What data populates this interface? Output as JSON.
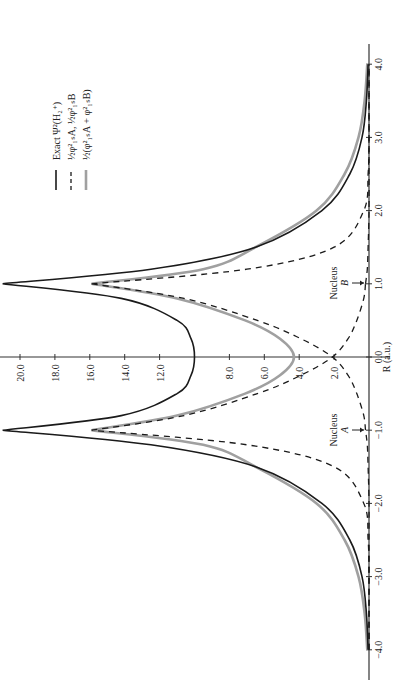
{
  "chart_data": {
    "type": "line",
    "orientation": "rotated-90-ccw",
    "title": "",
    "xlabel": "R (a.u.)",
    "ylabel": "",
    "xlim": [
      -4.2,
      4.3
    ],
    "ylim": [
      0,
      21
    ],
    "x_ticks": [
      "-4.0",
      "-3.0",
      "-2.0",
      "-1.0",
      "0.0",
      "1.0",
      "2.0",
      "3.0",
      "4.0"
    ],
    "x_tick_values": [
      -4.0,
      -3.0,
      -2.0,
      -1.0,
      0.0,
      1.0,
      2.0,
      3.0,
      4.0
    ],
    "y_ticks": [
      "2.0",
      "4.0",
      "6.0",
      "8.0",
      "12.0",
      "14.0",
      "16.0",
      "18.0",
      "20.0"
    ],
    "y_tick_values": [
      2.0,
      4.0,
      6.0,
      8.0,
      12.0,
      14.0,
      16.0,
      18.0,
      20.0
    ],
    "grid": false,
    "legend_position": "upper-left (rotated)",
    "annotations": [
      {
        "text": "Nucleus",
        "sub": "A",
        "at_x": -1.0
      },
      {
        "text": "Nucleus",
        "sub": "B",
        "at_x": 1.0
      }
    ],
    "x": [
      -4.0,
      -3.5,
      -3.0,
      -2.5,
      -2.0,
      -1.5,
      -1.2,
      -1.0,
      -0.8,
      -0.5,
      -0.25,
      0.0,
      0.25,
      0.5,
      0.8,
      1.0,
      1.2,
      1.5,
      2.0,
      2.5,
      3.0,
      3.5,
      4.0
    ],
    "series": [
      {
        "name": "Exact Ψ²(H₂⁺)",
        "style": "solid-black",
        "values": [
          0.05,
          0.15,
          0.4,
          1.1,
          2.7,
          6.5,
          12.5,
          21.0,
          14.2,
          11.0,
          10.2,
          10.0,
          10.2,
          11.0,
          14.2,
          21.0,
          12.5,
          6.5,
          2.7,
          1.1,
          0.4,
          0.15,
          0.05
        ]
      },
      {
        "name": "½φ²₁ₛA, ½φ²₁ₛB",
        "style": "dashed-black",
        "values": [
          0.0,
          0.0,
          0.0,
          0.05,
          0.3,
          2.0,
          7.0,
          15.9,
          10.6,
          6.4,
          3.9,
          2.1,
          1.2,
          0.7,
          0.3,
          0.2,
          0.1,
          0.05,
          0.0,
          0.0,
          0.0,
          0.0,
          0.0
        ]
      },
      {
        "name": "½(φ²₁ₛA + φ²₁ₛB)",
        "style": "solid-gray",
        "values": [
          0.1,
          0.25,
          0.6,
          1.4,
          3.0,
          6.5,
          9.5,
          15.9,
          11.0,
          7.1,
          5.1,
          4.3,
          5.1,
          7.1,
          11.0,
          15.9,
          9.5,
          6.5,
          3.0,
          1.4,
          0.6,
          0.25,
          0.1
        ]
      }
    ]
  },
  "legend": {
    "items": [
      {
        "label": "Exact Ψ²(H₂⁺)",
        "style": "solid-black"
      },
      {
        "label": "½φ²₁ₛA, ½φ²₁ₛB",
        "style": "dashed-black"
      },
      {
        "label": "½(φ²₁ₛA + φ²₁ₛB)",
        "style": "solid-gray"
      }
    ]
  },
  "axis": {
    "x_title": "R (a.u.)",
    "x_ticks": [
      "-4.0",
      "-3.0",
      "-2.0",
      "-1.0",
      "0.0",
      "1.0",
      "2.0",
      "3.0",
      "4.0"
    ],
    "y_ticks": [
      "2.0",
      "4.0",
      "6.0",
      "8.0",
      "12.0",
      "14.0",
      "16.0",
      "18.0",
      "20.0"
    ]
  },
  "annotations": {
    "nucleus_a": {
      "label": "Nucleus",
      "letter": "A"
    },
    "nucleus_b": {
      "label": "Nucleus",
      "letter": "B"
    }
  },
  "colors": {
    "exact": "#1a1a1a",
    "dashed": "#1a1a1a",
    "gray": "#a0a0a0",
    "axis": "#333333"
  }
}
